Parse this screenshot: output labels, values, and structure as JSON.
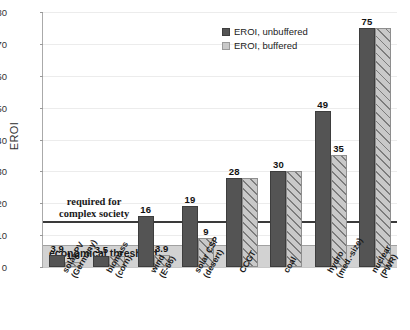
{
  "chart_data": {
    "type": "bar",
    "title": "",
    "xlabel": "",
    "ylabel": "EROI",
    "ylim": [
      0,
      80
    ],
    "yticks": [
      0,
      10,
      20,
      30,
      40,
      50,
      60,
      70,
      80
    ],
    "grid": true,
    "legend_position": "top-right",
    "categories": [
      "solar PV\n(Germany)",
      "biomass\n(corn)",
      "wind\n(E-66)",
      "solar CSP\n(desert)",
      "CCGT",
      "coal",
      "hydro\n(med.-size)",
      "nuclear\n(PWR)"
    ],
    "category_lines": [
      [
        "solar PV",
        "(Germany)"
      ],
      [
        "biomass",
        "(corn)"
      ],
      [
        "wind",
        "(E-66)"
      ],
      [
        "solar CSP",
        "(desert)"
      ],
      [
        "CCGT",
        ""
      ],
      [
        "coal",
        ""
      ],
      [
        "hydro",
        "(med.-size)"
      ],
      [
        "nuclear",
        "(PWR)"
      ]
    ],
    "series": [
      {
        "name": "EROI, unbuffered",
        "color": "#545454",
        "values": [
          3.9,
          3.5,
          16,
          19,
          28,
          30,
          49,
          75
        ],
        "labels": [
          "3.9",
          "3.5",
          "16",
          "19",
          "28",
          "30",
          "49",
          "75"
        ]
      },
      {
        "name": "EROI, buffered",
        "color": "#c9c9c9",
        "values": [
          1.6,
          3.5,
          3.9,
          9,
          28,
          30,
          35,
          75
        ],
        "labels": [
          "1.6",
          "",
          "3.9",
          "9",
          "",
          "",
          "35",
          ""
        ]
      }
    ],
    "reference_lines": [
      {
        "name": "required-for-complex-society",
        "value": 14,
        "label_lines": [
          "required for",
          "complex society"
        ],
        "color": "#3a3a3a"
      },
      {
        "name": "economical-threshold",
        "value": 7,
        "label_lines": [
          "economical threshold"
        ],
        "color": "#cfcfcf"
      }
    ]
  },
  "legend": {
    "items": [
      {
        "label": "EROI, unbuffered",
        "swatch": "dark-square-swatch"
      },
      {
        "label": "EROI, buffered",
        "swatch": "light-square-swatch"
      }
    ]
  }
}
